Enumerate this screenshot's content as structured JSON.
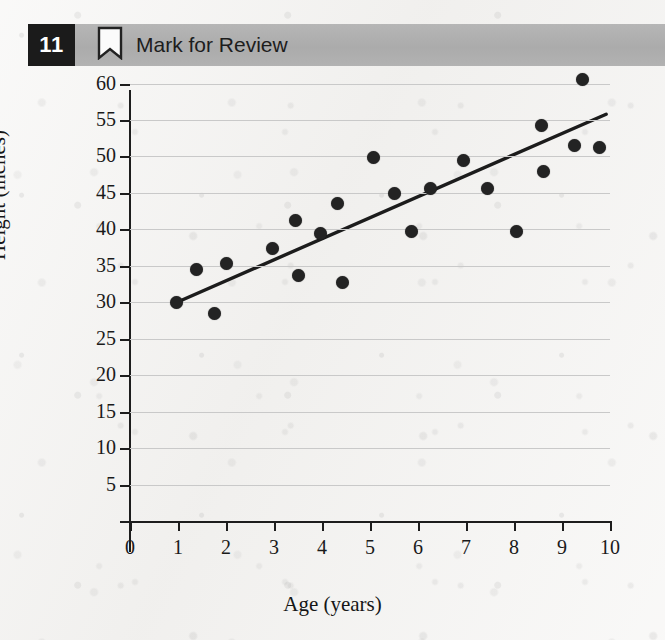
{
  "header": {
    "question_number": "11",
    "mark_label": "Mark for Review",
    "bookmark_icon": "bookmark-outline-icon",
    "badge_color": "#1b1b1b",
    "bar_color": "#b0b0b0"
  },
  "chart_data": {
    "type": "scatter",
    "title": "",
    "xlabel": "Age (years)",
    "ylabel": "Height (inches)",
    "xlim": [
      0,
      10
    ],
    "ylim": [
      0,
      62
    ],
    "xticks": [
      0,
      1,
      2,
      3,
      4,
      5,
      6,
      7,
      8,
      9,
      10
    ],
    "yticks": [
      5,
      10,
      15,
      20,
      25,
      30,
      35,
      40,
      45,
      50,
      55,
      60
    ],
    "grid": true,
    "legend": "none",
    "point_color": "#232323",
    "line_color": "#1c1c1c",
    "points": [
      {
        "x": 0.97,
        "y": 30.0
      },
      {
        "x": 1.38,
        "y": 34.5
      },
      {
        "x": 1.77,
        "y": 28.5
      },
      {
        "x": 2.02,
        "y": 35.3
      },
      {
        "x": 2.97,
        "y": 37.4
      },
      {
        "x": 3.45,
        "y": 41.2
      },
      {
        "x": 3.52,
        "y": 33.7
      },
      {
        "x": 3.97,
        "y": 39.4
      },
      {
        "x": 4.33,
        "y": 43.6
      },
      {
        "x": 4.43,
        "y": 32.7
      },
      {
        "x": 5.08,
        "y": 49.9
      },
      {
        "x": 5.52,
        "y": 44.9
      },
      {
        "x": 5.87,
        "y": 39.7
      },
      {
        "x": 6.25,
        "y": 45.6
      },
      {
        "x": 6.95,
        "y": 49.4
      },
      {
        "x": 7.45,
        "y": 45.6
      },
      {
        "x": 8.05,
        "y": 39.7
      },
      {
        "x": 8.57,
        "y": 54.2
      },
      {
        "x": 8.62,
        "y": 47.9
      },
      {
        "x": 9.25,
        "y": 51.5
      },
      {
        "x": 9.42,
        "y": 60.6
      },
      {
        "x": 9.78,
        "y": 51.3
      }
    ],
    "trendline": {
      "x0": 0.98,
      "y0": 30.0,
      "x1": 9.92,
      "y1": 55.8
    }
  }
}
